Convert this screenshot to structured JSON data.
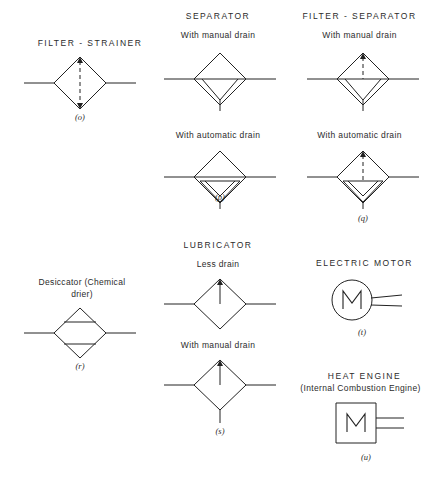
{
  "diagram": {
    "title_filter_strainer": "FILTER - STRAINER",
    "title_separator": "SEPARATOR",
    "title_filter_separator": "FILTER - SEPARATOR",
    "title_lubricator": "LUBRICATOR",
    "title_electric_motor": "ELECTRIC MOTOR",
    "title_heat_engine": "HEAT ENGINE",
    "subtitle_heat_engine": "(Internal Combustion Engine)",
    "label_desiccator_line1": "Desiccator (Chemical",
    "label_desiccator_line2": "drier)",
    "sub_manual_drain_sep": "With manual drain",
    "sub_automatic_drain_sep": "With automatic drain",
    "sub_manual_drain_fs": "With manual drain",
    "sub_automatic_drain_fs": "With automatic drain",
    "sub_less_drain": "Less drain",
    "sub_manual_drain_lub": "With manual drain",
    "caption_o": "(o)",
    "caption_p": "(p)",
    "caption_q": "(q)",
    "caption_r": "(r)",
    "caption_s": "(s)",
    "caption_t": "(t)",
    "caption_u": "(u)",
    "motor_glyph": "M",
    "engine_glyph": "M",
    "ink_color": "#222222",
    "background_color": "#ffffff"
  }
}
